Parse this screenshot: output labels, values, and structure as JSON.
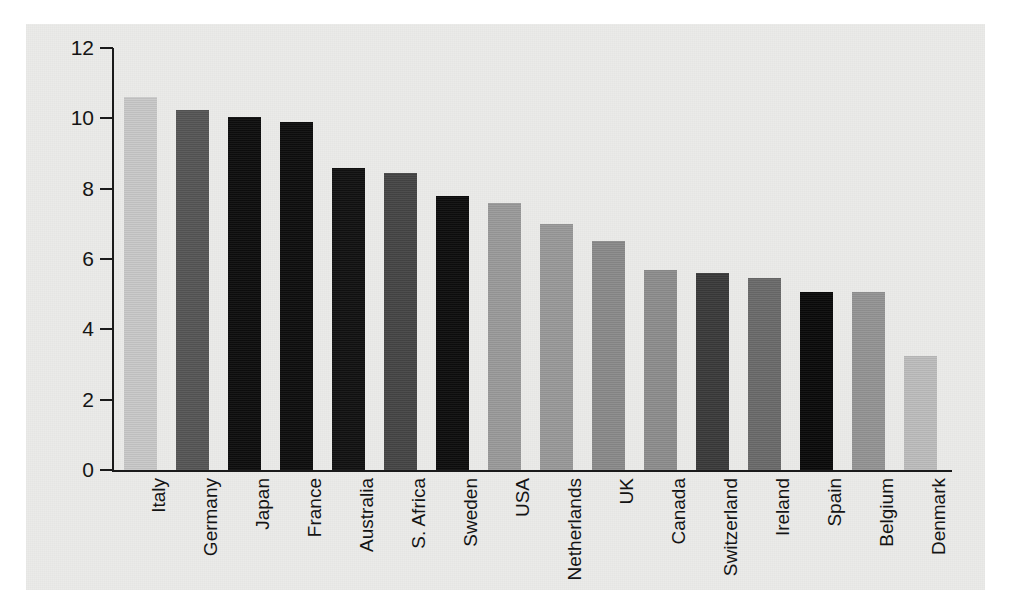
{
  "chart_data": {
    "type": "bar",
    "title": "",
    "subtitle": "",
    "xlabel": "",
    "ylabel": "",
    "ylim": [
      0,
      12
    ],
    "ytick_values": [
      0,
      2,
      4,
      6,
      8,
      10,
      12
    ],
    "ytick_labels": [
      "0",
      "2",
      "4",
      "6",
      "8",
      "10",
      "12"
    ],
    "grid": false,
    "legend": "none",
    "orientation": "vertical",
    "xtick_label_rotation": -90,
    "categories": [
      "Italy",
      "Germany",
      "Japan",
      "France",
      "Australia",
      "S. Africa",
      "Sweden",
      "USA",
      "Netherlands",
      "UK",
      "Canada",
      "Switzerland",
      "Ireland",
      "Spain",
      "Belgium",
      "Denmark"
    ],
    "values": [
      10.6,
      10.25,
      10.05,
      9.9,
      8.6,
      8.45,
      7.8,
      7.6,
      7.0,
      6.5,
      5.7,
      5.6,
      5.45,
      5.05,
      5.05,
      3.25
    ],
    "bar_colors": [
      "#c8c8c8",
      "#555555",
      "#0d0d0d",
      "#0d0d0d",
      "#111111",
      "#454545",
      "#0d0d0d",
      "#9a9a9a",
      "#999999",
      "#8a8a8a",
      "#8d8d8d",
      "#3a3a3a",
      "#6a6a6a",
      "#0a0a0a",
      "#949494",
      "#bdbdbd"
    ]
  },
  "figure": {
    "background_color": "#ffffff",
    "panel_color": "#ebebe9",
    "axis_color": "#1a1a1a"
  }
}
